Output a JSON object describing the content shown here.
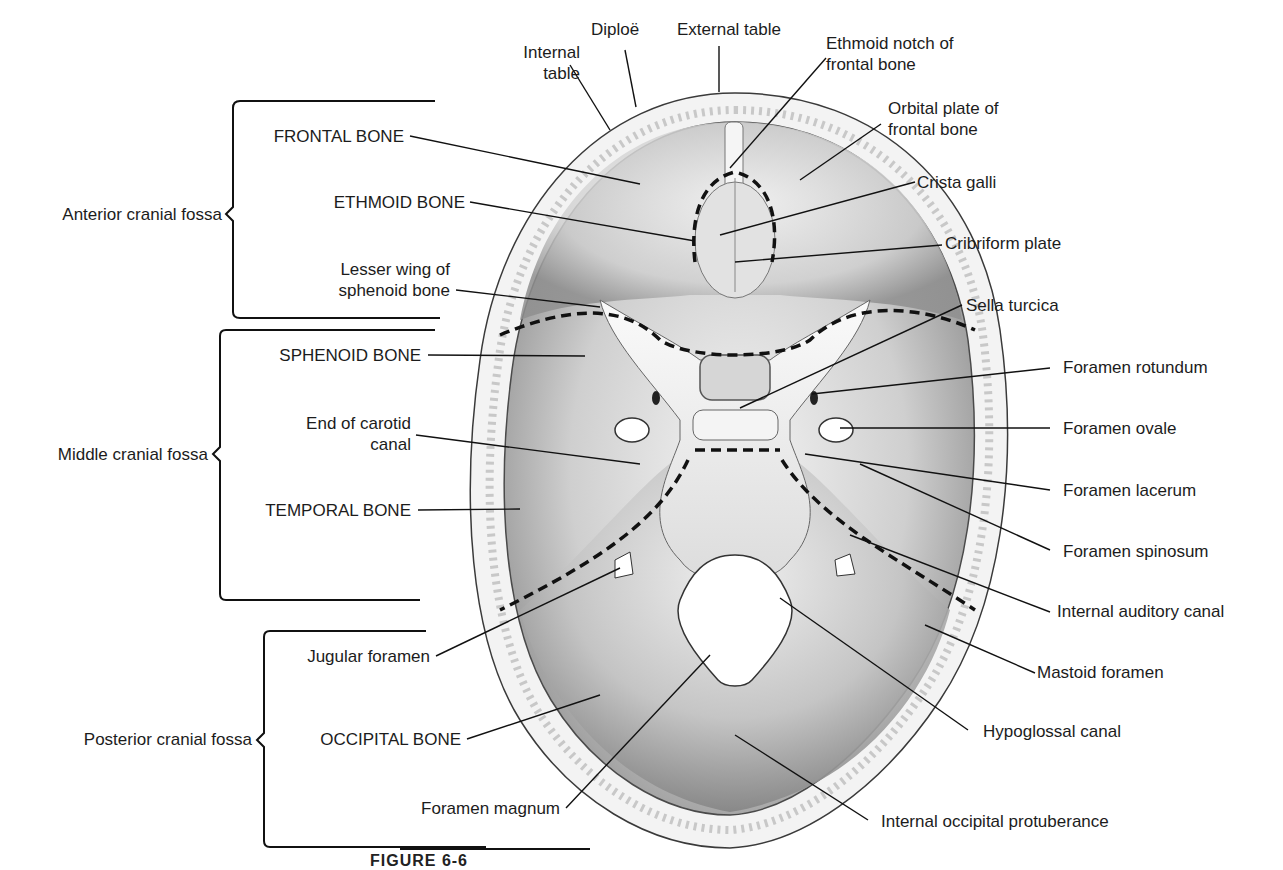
{
  "figure": {
    "caption_partial": "FIGURE 6-6"
  },
  "fossae": [
    {
      "id": "anterior",
      "label": "Anterior cranial fossa"
    },
    {
      "id": "middle",
      "label": "Middle cranial fossa"
    },
    {
      "id": "posterior",
      "label": "Posterior cranial fossa"
    }
  ],
  "labels_left": {
    "internal_table": {
      "line1": "Internal",
      "line2": "table"
    },
    "diploe": "Diploë",
    "external_table": "External table",
    "frontal_bone": "FRONTAL BONE",
    "ethmoid_bone": "ETHMOID BONE",
    "lesser_wing": {
      "line1": "Lesser wing of",
      "line2": "sphenoid bone"
    },
    "sphenoid_bone": "SPHENOID BONE",
    "carotid_canal": {
      "line1": "End of carotid",
      "line2": "canal"
    },
    "temporal_bone": "TEMPORAL BONE",
    "jugular_foramen": "Jugular foramen",
    "occipital_bone": "OCCIPITAL BONE",
    "foramen_magnum": "Foramen magnum"
  },
  "labels_right": {
    "ethmoid_notch": {
      "line1": "Ethmoid notch of",
      "line2": "frontal bone"
    },
    "orbital_plate": {
      "line1": "Orbital plate of",
      "line2": "frontal bone"
    },
    "crista_galli": "Crista galli",
    "cribriform_plate": "Cribriform plate",
    "sella_turcica": "Sella turcica",
    "foramen_rotundum": "Foramen rotundum",
    "foramen_ovale": "Foramen ovale",
    "foramen_lacerum": "Foramen lacerum",
    "foramen_spinosum": "Foramen spinosum",
    "internal_auditory_canal": "Internal auditory canal",
    "mastoid_foramen": "Mastoid foramen",
    "hypoglossal_canal": "Hypoglossal canal",
    "internal_occipital_protuberance": "Internal occipital protuberance"
  },
  "colors": {
    "ink": "#1c1c1c",
    "bone_light": "#f2f2f2",
    "bone_mid": "#bdbdbd",
    "bone_dark": "#7a7a7a",
    "table_rim": "#eeeeee"
  }
}
